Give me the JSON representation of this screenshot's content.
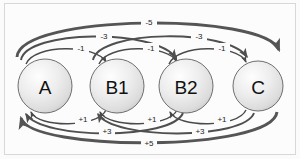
{
  "diagram": {
    "background_color": "#fbfbfb",
    "frame_color": "#d8d8d8",
    "node_fill_light": "#fdfdfd",
    "node_fill_dark": "#c9c9c9",
    "node_stroke": "#6e6e6e",
    "arc_color_thin": "#4a4a4a",
    "arc_color_thick": "#555555",
    "nodes": [
      {
        "id": "A",
        "label": "A",
        "cx": 45,
        "cy": 86,
        "r": 27
      },
      {
        "id": "B1",
        "label": "B1",
        "cx": 117,
        "cy": 86,
        "r": 27
      },
      {
        "id": "B2",
        "label": "B2",
        "cx": 186,
        "cy": 86,
        "r": 27
      },
      {
        "id": "C",
        "label": "C",
        "cx": 258,
        "cy": 86,
        "r": 25
      }
    ],
    "top_edges": [
      {
        "id": "a-b1",
        "from": "A",
        "to": "B1",
        "weight": "-1",
        "label_x": 81,
        "label_y": 48,
        "thickness": 1.4
      },
      {
        "id": "b1-b2",
        "from": "B1",
        "to": "B2",
        "weight": "-1",
        "label_x": 151,
        "label_y": 48,
        "thickness": 1.4
      },
      {
        "id": "b2-c",
        "from": "B2",
        "to": "C",
        "weight": "-1",
        "label_x": 222,
        "label_y": 48,
        "thickness": 1.4
      },
      {
        "id": "a-b2",
        "from": "A",
        "to": "B2",
        "weight": "-3",
        "label_x": 104,
        "label_y": 36,
        "thickness": 2.0
      },
      {
        "id": "b1-c",
        "from": "B1",
        "to": "C",
        "weight": "-3",
        "label_x": 199,
        "label_y": 36,
        "thickness": 2.0
      },
      {
        "id": "a-c",
        "from": "A",
        "to": "C",
        "weight": "-5",
        "label_x": 149,
        "label_y": 22,
        "thickness": 2.8
      }
    ],
    "bottom_edges": [
      {
        "id": "b1-a",
        "from": "B1",
        "to": "A",
        "weight": "+1",
        "label_x": 83,
        "label_y": 119,
        "thickness": 1.4
      },
      {
        "id": "b2-b1",
        "from": "B2",
        "to": "B1",
        "weight": "+1",
        "label_x": 152,
        "label_y": 119,
        "thickness": 1.4
      },
      {
        "id": "c-b2",
        "from": "C",
        "to": "B2",
        "weight": "+1",
        "label_x": 222,
        "label_y": 119,
        "thickness": 1.4
      },
      {
        "id": "b2-a",
        "from": "B2",
        "to": "A",
        "weight": "+3",
        "label_x": 107,
        "label_y": 131,
        "thickness": 2.0
      },
      {
        "id": "c-b1",
        "from": "C",
        "to": "B1",
        "weight": "+3",
        "label_x": 200,
        "label_y": 131,
        "thickness": 2.0
      },
      {
        "id": "c-a",
        "from": "C",
        "to": "A",
        "weight": "+5",
        "label_x": 149,
        "label_y": 143,
        "thickness": 2.8
      }
    ]
  }
}
